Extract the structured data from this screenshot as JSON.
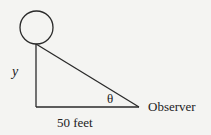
{
  "diagram": {
    "labels": {
      "vertical_side": "y",
      "angle": "θ",
      "observer": "Observer",
      "base": "50 feet"
    },
    "shapes": {
      "balloon": {
        "cx": 36.5,
        "cy": 27.5,
        "r": 16.5
      },
      "triangle": {
        "top": [
          36,
          44
        ],
        "right_angle": [
          36,
          107
        ],
        "observer": [
          139,
          107
        ]
      }
    },
    "colors": {
      "stroke": "#2a2a2a",
      "background": "#f4f4f2"
    }
  }
}
